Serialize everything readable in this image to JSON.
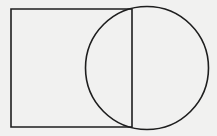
{
  "diagram": {
    "shapes": [
      "rectangle",
      "circle",
      "vertical-chord"
    ],
    "labels": [],
    "colors": {
      "background": "#f1f1f0",
      "stroke": "#1e1e1e"
    }
  }
}
